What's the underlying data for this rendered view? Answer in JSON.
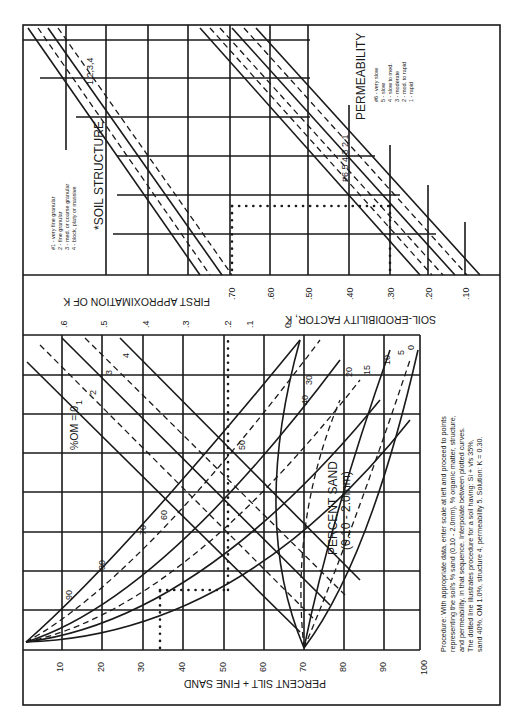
{
  "figure": {
    "orientation": "rotated 90 degrees counter-clockwise",
    "upper_panel": {
      "soil_structure": {
        "title": "*SOIL STRUCTURE",
        "curve_labels": "1,2,3,4",
        "legend": [
          "#1 - very fine granular",
          "2 - fine granular",
          "3 - med. or coarse granular",
          "4 - block, platy or massive"
        ]
      },
      "permeability": {
        "title": "PERMEABILITY",
        "curve_labels": "#6 5 4 3 2 1",
        "legend": [
          "#6 - very slow",
          "5 - slow",
          "4 - slow to med.",
          "3 - moderate",
          "2 - mod. to rapid",
          "1 - rapid"
        ]
      },
      "k_axis": {
        "title": "SOIL-ERODIBILITY FACTOR, K",
        "ticks": [
          ".70",
          ".60",
          ".50",
          ".40",
          ".30",
          ".20",
          ".10"
        ]
      }
    },
    "first_approx_axis": {
      "title": "FIRST APPROXIMATION OF K",
      "ticks": [
        ".6",
        ".5",
        ".4",
        ".3",
        ".2",
        ".1",
        "0"
      ]
    },
    "lower_panel": {
      "om_label": "%OM = 0",
      "om_curves": [
        "1",
        "2",
        "3",
        "4"
      ],
      "sand_label_1": "PERCENT SAND",
      "sand_label_2": "(0.10 - 2.0mm)",
      "sand_curves": [
        "90",
        "80",
        "70",
        "60",
        "50",
        "40",
        "30",
        "20",
        "15",
        "10",
        "5",
        "0"
      ],
      "x_axis": {
        "title": "PERCENT SILT + FINE SAND",
        "ticks": [
          "10",
          "20",
          "30",
          "40",
          "50",
          "60",
          "70",
          "80",
          "90",
          "100"
        ]
      }
    },
    "procedure": {
      "lines": [
        "Procedure: With appropriate data, enter scale at left and proceed to points",
        "representing the soil's % sand (0.10 - 2.0mm), % organic matter, structure,",
        "and permeability, in that sequence. Interpolate between plotted curves.",
        "The dotted line illustrates procedure for a soil having: Si + vfs 35%,",
        "sand 40%, OM 1.0%, structure 4, permeability 5. Solution: K = 0.30."
      ]
    },
    "example": {
      "silt_fine_sand_pct": 35,
      "sand_pct": 40,
      "om_pct": 1.0,
      "structure": 4,
      "permeability": 5,
      "first_approx_k": 0.2,
      "solution_k": 0.3
    }
  }
}
